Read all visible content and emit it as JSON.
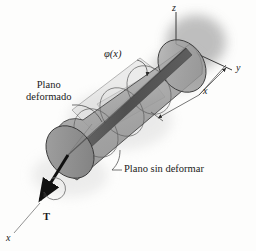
{
  "figure": {
    "background_color": "#fdfdfc",
    "ink_color": "#1a1a1a"
  },
  "axes": {
    "z_label": "z",
    "y_label": "y",
    "x_label": "x",
    "origin_note": "axes meet at far end of shaft"
  },
  "labels": {
    "angle_of_twist": "φ(x)",
    "deformed_plane_line1": "Plano",
    "deformed_plane_line2": "deformado",
    "undeformed_plane": "Plano sin deformar",
    "torque": "T",
    "distance_dimension": "x"
  },
  "shaft": {
    "body_fill": "#a9a9a9",
    "body_fill_light": "#c2c2c2",
    "near_face_fill": "#8c8c8c",
    "far_face_fill": "#9b9b9b",
    "axial_strip_fill": "#5a5a5a",
    "outline_color": "#3c3c3c",
    "shadow_color": "#b8b8b8"
  },
  "planes": {
    "deformed_plane_fill": "#cfcfcf",
    "undeformed_plane_fill": "#bdbdbd"
  },
  "annotations": {
    "leader_lines": 3,
    "dimension_arrows": 2,
    "twist_arrow": "circular arrow about shaft axis at torque end"
  }
}
